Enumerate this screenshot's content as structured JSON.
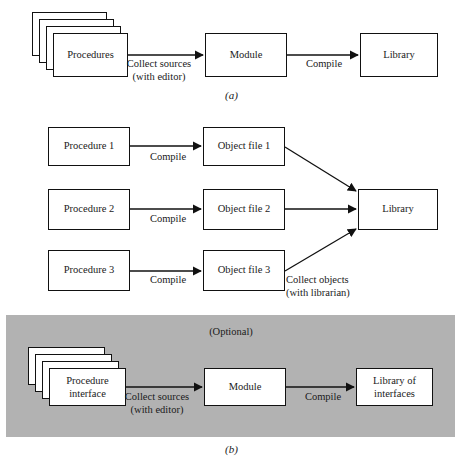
{
  "figure": {
    "panels": [
      {
        "id": "a",
        "caption": "(a)",
        "nodes": [
          {
            "name": "procedures",
            "label": "Procedures",
            "stacked": true
          },
          {
            "name": "module",
            "label": "Module",
            "stacked": false
          },
          {
            "name": "library",
            "label": "Library",
            "stacked": false
          }
        ],
        "edges": [
          {
            "name": "collect-sources",
            "label": "Collect sources\n(with editor)",
            "from": "procedures",
            "to": "module"
          },
          {
            "name": "compile",
            "label": "Compile",
            "from": "module",
            "to": "library"
          }
        ]
      },
      {
        "id": "b-top",
        "caption": "",
        "nodes": [
          {
            "name": "procedure-1",
            "label": "Procedure 1",
            "stacked": false
          },
          {
            "name": "procedure-2",
            "label": "Procedure 2",
            "stacked": false
          },
          {
            "name": "procedure-3",
            "label": "Procedure 3",
            "stacked": false
          },
          {
            "name": "object-file-1",
            "label": "Object file 1",
            "stacked": false
          },
          {
            "name": "object-file-2",
            "label": "Object file 2",
            "stacked": false
          },
          {
            "name": "object-file-3",
            "label": "Object file 3",
            "stacked": false
          },
          {
            "name": "library",
            "label": "Library",
            "stacked": false
          }
        ],
        "edges": [
          {
            "name": "compile-1",
            "label": "Compile",
            "from": "procedure-1",
            "to": "object-file-1"
          },
          {
            "name": "compile-2",
            "label": "Compile",
            "from": "procedure-2",
            "to": "object-file-2"
          },
          {
            "name": "compile-3",
            "label": "Compile",
            "from": "procedure-3",
            "to": "object-file-3"
          },
          {
            "name": "collect-objects",
            "label": "Collect objects\n(with librarian)",
            "from": "object-file-3",
            "to": "library"
          }
        ]
      },
      {
        "id": "b-optional",
        "caption": "(b)",
        "panel_label": "(Optional)",
        "panel_color": "#b2b2b2",
        "nodes": [
          {
            "name": "procedure-interface",
            "label": "Procedure\ninterface",
            "stacked": true
          },
          {
            "name": "module",
            "label": "Module",
            "stacked": false
          },
          {
            "name": "library-of-interfaces",
            "label": "Library of\ninterfaces",
            "stacked": false
          }
        ],
        "edges": [
          {
            "name": "collect-sources",
            "label": "Collect sources\n(with editor)",
            "from": "procedure-interface",
            "to": "module"
          },
          {
            "name": "compile",
            "label": "Compile",
            "from": "module",
            "to": "library-of-interfaces"
          }
        ]
      }
    ],
    "labels": {
      "procedures": "Procedures",
      "module_a": "Module",
      "library_a": "Library",
      "collect_sources_a_l1": "Collect sources",
      "collect_sources_a_l2": "(with editor)",
      "compile_a": "Compile",
      "caption_a": "(a)",
      "procedure_1": "Procedure 1",
      "procedure_2": "Procedure 2",
      "procedure_3": "Procedure 3",
      "object_file_1": "Object file 1",
      "object_file_2": "Object file 2",
      "object_file_3": "Object file 3",
      "compile_1": "Compile",
      "compile_2": "Compile",
      "compile_3": "Compile",
      "library_b": "Library",
      "collect_objects_l1": "Collect objects",
      "collect_objects_l2": "(with librarian)",
      "optional": "(Optional)",
      "procedure_interface_l1": "Procedure",
      "procedure_interface_l2": "interface",
      "module_b": "Module",
      "collect_sources_b_l1": "Collect sources",
      "collect_sources_b_l2": "(with editor)",
      "compile_b": "Compile",
      "library_of_interfaces_l1": "Library of",
      "library_of_interfaces_l2": "interfaces",
      "caption_b": "(b)"
    }
  }
}
